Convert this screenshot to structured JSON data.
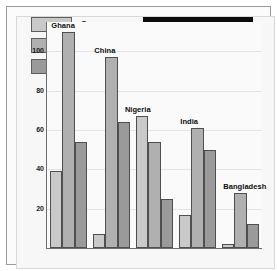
{
  "banner": {
    "text": "LOW INCOME"
  },
  "caption": {
    "lines": [
      "Number of cars, televisions",
      "& telephones for each",
      "10,000 people, selected low",
      "income countries",
      "(latest figures, 1983-1988)"
    ]
  },
  "legend": {
    "items": [
      {
        "label": "Cars",
        "color": "#c9c9c9"
      },
      {
        "label": "Televisions",
        "color": "#b0b0b0"
      },
      {
        "label": "Telephones",
        "color": "#9a9a9a"
      }
    ]
  },
  "chart_data": {
    "type": "bar",
    "title": "LOW INCOME",
    "subtitle": "Number of cars, televisions & telephones for each 10,000 people, selected low income countries (latest figures, 1983-1988)",
    "categories": [
      "Ghana",
      "China",
      "Nigeria",
      "India",
      "Bangladesh"
    ],
    "series": [
      {
        "name": "Cars",
        "color": "#c9c9c9",
        "values": [
          39,
          7,
          67,
          17,
          2
        ]
      },
      {
        "name": "Televisions",
        "color": "#b0b0b0",
        "values": [
          110,
          97,
          54,
          61,
          28
        ]
      },
      {
        "name": "Telephones",
        "color": "#9a9a9a",
        "values": [
          54,
          64,
          25,
          50,
          12
        ]
      }
    ],
    "xlabel": "",
    "ylabel": "",
    "ylim": [
      0,
      115
    ],
    "yticks": [
      20,
      40,
      60,
      80,
      100
    ],
    "grid": true,
    "legend_position": "top-left"
  }
}
